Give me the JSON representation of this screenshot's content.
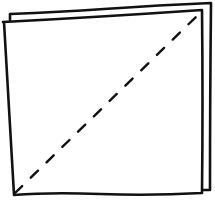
{
  "diagram": {
    "stroke_color": "#111111",
    "background_color": "#ffffff",
    "back_sheet": {
      "points": "10,14 10,6 104,6 211,3 210,190 202,190"
    },
    "front_sheet": {
      "points": "3,22 202,10 202,193 14,195"
    },
    "fold_line": {
      "x1": 15,
      "y1": 193,
      "x2": 199,
      "y2": 14,
      "dash": "10,12",
      "style": "dashed"
    }
  }
}
